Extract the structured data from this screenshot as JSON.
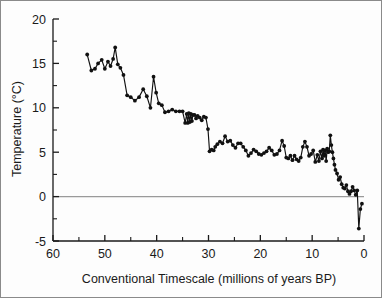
{
  "figure": {
    "background_color": "#fdfdfd",
    "border_color": "#8a8a8a",
    "series_color": "#111111",
    "zero_line_color": "#9a9a9a"
  },
  "axes": {
    "y_title": "Temperature (°C)",
    "x_title": "Conventional Timescale (millions of years BP)",
    "x_ticklabels": [
      "60",
      "50",
      "40",
      "30",
      "20",
      "10",
      "0"
    ],
    "y_ticklabels": [
      "20",
      "15",
      "10",
      "5",
      "0",
      "-5"
    ]
  },
  "chart_data": {
    "type": "line",
    "title": "",
    "xlabel": "Conventional Timescale (millions of years BP)",
    "ylabel": "Temperature (°C)",
    "xlim": [
      60,
      0
    ],
    "ylim": [
      -5,
      20
    ],
    "x_reversed": true,
    "grid": false,
    "legend": null,
    "x_major_ticks": [
      60,
      50,
      40,
      30,
      20,
      10,
      0
    ],
    "y_major_ticks": [
      20,
      15,
      10,
      5,
      0,
      -5
    ],
    "x_minor_tick_interval": 5,
    "y_minor_tick_interval": 2.5,
    "annotations": [
      {
        "type": "hline",
        "y": 0,
        "label": "0 °C reference line",
        "color": "#9a9a9a"
      }
    ],
    "markers": "filled-circle",
    "series": [
      {
        "name": "Deep-sea benthic temperature",
        "x": [
          53.4,
          52.6,
          51.9,
          51.3,
          50.6,
          50.0,
          49.4,
          48.9,
          48.4,
          48.0,
          47.5,
          47.0,
          46.4,
          45.7,
          45.0,
          44.2,
          43.4,
          42.6,
          41.9,
          41.2,
          40.6,
          40.1,
          39.6,
          39.0,
          38.4,
          37.7,
          37.0,
          36.3,
          35.6,
          35.0,
          34.5,
          34.2,
          34.0,
          33.8,
          33.6,
          33.4,
          33.2,
          33.0,
          32.7,
          32.4,
          32.1,
          31.7,
          31.3,
          30.9,
          30.5,
          30.1,
          29.8,
          29.4,
          29.0,
          28.7,
          28.3,
          27.8,
          27.3,
          26.8,
          26.3,
          25.8,
          25.3,
          24.8,
          24.3,
          23.8,
          23.3,
          22.8,
          22.3,
          21.8,
          21.3,
          20.8,
          20.3,
          19.8,
          19.3,
          18.8,
          18.3,
          17.8,
          17.3,
          16.8,
          16.3,
          15.8,
          15.4,
          15.0,
          14.6,
          14.2,
          13.8,
          13.4,
          13.0,
          12.6,
          12.2,
          11.8,
          11.4,
          11.0,
          10.6,
          10.2,
          9.8,
          9.4,
          9.0,
          8.7,
          8.4,
          8.1,
          7.9,
          7.7,
          7.5,
          7.3,
          7.1,
          6.9,
          6.7,
          6.5,
          6.3,
          6.1,
          5.9,
          5.7,
          5.5,
          5.2,
          4.9,
          4.6,
          4.3,
          4.0,
          3.7,
          3.4,
          3.1,
          2.8,
          2.5,
          2.2,
          1.9,
          1.6,
          1.3,
          1.0,
          0.7,
          0.4
        ],
        "y": [
          16.0,
          14.2,
          14.4,
          15.0,
          15.4,
          14.4,
          15.2,
          14.7,
          15.5,
          16.8,
          14.9,
          14.5,
          13.7,
          11.4,
          11.2,
          10.8,
          11.2,
          12.1,
          11.3,
          10.0,
          13.5,
          11.7,
          10.5,
          10.3,
          9.5,
          9.6,
          9.8,
          9.6,
          9.6,
          9.6,
          8.3,
          9.3,
          8.3,
          9.4,
          8.4,
          9.3,
          8.5,
          9.2,
          9.2,
          8.8,
          9.1,
          8.9,
          8.6,
          9.0,
          8.9,
          7.6,
          5.1,
          5.3,
          5.2,
          5.6,
          5.9,
          6.2,
          6.0,
          6.8,
          6.2,
          6.3,
          5.8,
          5.5,
          6.0,
          6.0,
          5.6,
          5.2,
          4.6,
          4.9,
          5.3,
          5.1,
          4.8,
          4.7,
          4.9,
          5.1,
          5.5,
          5.2,
          4.7,
          4.8,
          5.2,
          6.3,
          5.7,
          4.4,
          4.3,
          4.6,
          4.1,
          4.6,
          4.2,
          4.0,
          4.4,
          5.6,
          6.2,
          5.6,
          4.6,
          4.8,
          5.2,
          3.9,
          4.7,
          4.0,
          5.1,
          4.3,
          5.3,
          4.6,
          5.2,
          4.0,
          5.4,
          5.0,
          5.1,
          6.9,
          5.8,
          5.0,
          4.3,
          3.6,
          3.0,
          2.6,
          1.9,
          2.2,
          1.4,
          1.0,
          0.9,
          1.3,
          0.6,
          0.3,
          0.6,
          1.1,
          0.7,
          0.2,
          0.7,
          -3.6,
          -1.4,
          -0.8
        ]
      }
    ]
  }
}
